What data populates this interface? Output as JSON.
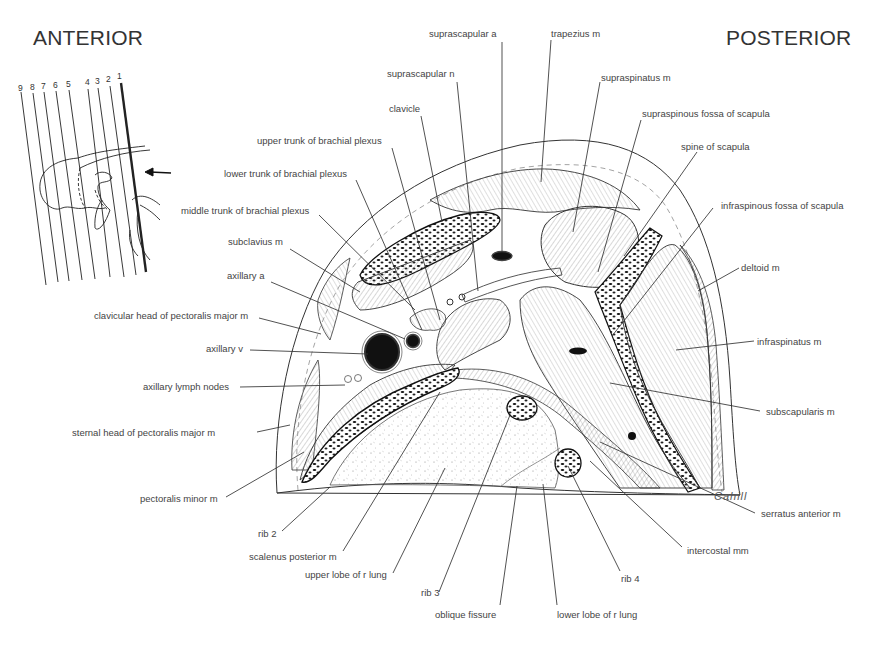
{
  "headings": {
    "anterior": "ANTERIOR",
    "posterior": "POSTERIOR"
  },
  "orientation_diagram": {
    "section_numbers": [
      "9",
      "8",
      "7",
      "6",
      "5",
      "4",
      "3",
      "2",
      "1"
    ],
    "highlighted_section": "1",
    "arrow": "left-arrow"
  },
  "signature": "Cahill",
  "labels": {
    "suprascapular_a": "suprascapular a",
    "trapezius_m": "trapezius m",
    "suprascapular_n": "suprascapular n",
    "supraspinatus_m": "supraspinatus m",
    "clavicle": "clavicle",
    "supraspinous_fossa": "supraspinous fossa of scapula",
    "upper_trunk": "upper trunk of brachial plexus",
    "spine_of_scapula": "spine of scapula",
    "lower_trunk": "lower trunk of brachial plexus",
    "middle_trunk": "middle trunk of brachial plexus",
    "infraspinous_fossa": "infraspinous fossa of scapula",
    "subclavius_m": "subclavius m",
    "deltoid_m": "deltoid m",
    "axillary_a": "axillary a",
    "clavicular_head_pm": "clavicular head of pectoralis major m",
    "infraspinatus_m": "infraspinatus m",
    "axillary_v": "axillary v",
    "axillary_lymph_nodes": "axillary lymph nodes",
    "subscapularis_m": "subscapularis m",
    "sternal_head_pm": "sternal head of pectoralis major m",
    "pectoralis_minor_m": "pectoralis minor m",
    "serratus_anterior_m": "serratus anterior m",
    "rib_2": "rib 2",
    "intercostal_mm": "intercostal mm",
    "scalenus_posterior_m": "scalenus posterior m",
    "upper_lobe_r_lung": "upper lobe of r lung",
    "rib_4": "rib 4",
    "rib_3": "rib 3",
    "oblique_fissure": "oblique fissure",
    "lower_lobe_r_lung": "lower lobe of r lung"
  }
}
